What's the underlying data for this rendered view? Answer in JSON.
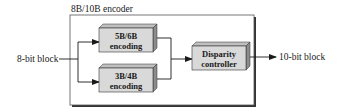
{
  "diagram": {
    "container": {
      "label": "8B/10B encoder"
    },
    "input": {
      "label": "8-bit block"
    },
    "output": {
      "label": "10-bit block"
    },
    "blocks": [
      {
        "id": "5b6b",
        "line1": "5B/6B",
        "line2": "encoding"
      },
      {
        "id": "3b4b",
        "line1": "3B/4B",
        "line2": "encoding"
      },
      {
        "id": "disparity",
        "line1": "Disparity",
        "line2": "controller"
      }
    ],
    "colors": {
      "block_face": "#d9d9d9",
      "block_top": "#bfbfbf",
      "block_side": "#8c8c8c",
      "line": "#1a1a1a",
      "container_shadow": "#333333"
    }
  }
}
